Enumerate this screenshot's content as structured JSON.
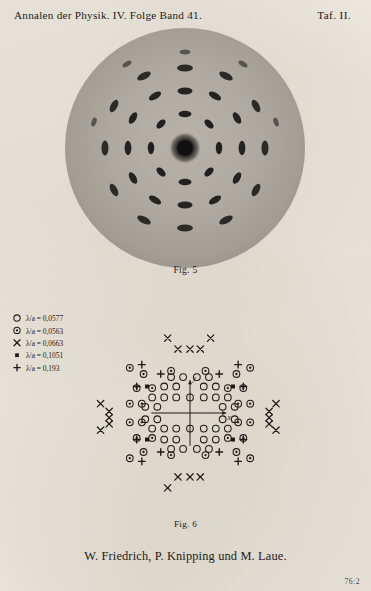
{
  "page": {
    "header_left": "Annalen der Physik.  IV. Folge    Band 41.",
    "header_right": "Taf. II.",
    "corner_mark": "76:2",
    "authors": "W. Friedrich, P. Knipping und M. Laue.",
    "paper_color": "#f2efe9",
    "ink_color": "#1d1b18"
  },
  "figures": {
    "fig5": {
      "caption": "Fig. 5",
      "description": "Laue X-ray diffraction photograph, circular plate with dark central beam spot and concentric rings of elliptical reflection spots showing four-fold symmetry",
      "plate_color": "#a8a49c",
      "center_spot_color": "#141414"
    },
    "fig6": {
      "caption": "Fig. 6",
      "axis_x_label": "x",
      "axis_y_label": "y",
      "description": "Indexed spot diagram of the Laue photograph; symbol type encodes the wavelength ratio lambda over a"
    }
  },
  "legend": {
    "items": [
      {
        "symbol": "open-circle",
        "label": "λ/a = 0,0577",
        "value": 0.0577
      },
      {
        "symbol": "circle-dot",
        "label": "λ/a = 0,0563",
        "value": 0.0563
      },
      {
        "symbol": "cross",
        "label": "λ/a = 0,0663",
        "value": 0.0663
      },
      {
        "symbol": "filled-square",
        "label": "λ/a = 0,1051",
        "value": 0.1051
      },
      {
        "symbol": "plus",
        "label": "λ/a = 0,193",
        "value": 0.193
      }
    ]
  },
  "chart_data": {
    "type": "scatter",
    "title": "Fig. 6",
    "xlabel": "x",
    "ylabel": "y",
    "grid": false,
    "legend_position": "upper-left",
    "xlim": [
      -115,
      115
    ],
    "ylim": [
      -105,
      105
    ],
    "series": [
      {
        "name": "λ/a = 0,0577",
        "symbol": "open-circle",
        "points": [
          [
            -30,
            34
          ],
          [
            -16,
            34
          ],
          [
            16,
            34
          ],
          [
            30,
            34
          ],
          [
            -44,
            20
          ],
          [
            -30,
            20
          ],
          [
            -16,
            20
          ],
          [
            0,
            20
          ],
          [
            16,
            20
          ],
          [
            30,
            20
          ],
          [
            44,
            20
          ],
          [
            -52,
            8
          ],
          [
            -38,
            8
          ],
          [
            38,
            8
          ],
          [
            52,
            8
          ],
          [
            -52,
            -8
          ],
          [
            -38,
            -8
          ],
          [
            38,
            -8
          ],
          [
            52,
            -8
          ],
          [
            -44,
            -20
          ],
          [
            -30,
            -20
          ],
          [
            -16,
            -20
          ],
          [
            0,
            -20
          ],
          [
            16,
            -20
          ],
          [
            30,
            -20
          ],
          [
            44,
            -20
          ],
          [
            -30,
            -34
          ],
          [
            -16,
            -34
          ],
          [
            16,
            -34
          ],
          [
            30,
            -34
          ],
          [
            -22,
            46
          ],
          [
            22,
            46
          ],
          [
            -22,
            -46
          ],
          [
            22,
            -46
          ],
          [
            -8,
            46
          ],
          [
            8,
            46
          ],
          [
            -8,
            -46
          ],
          [
            8,
            -46
          ]
        ]
      },
      {
        "name": "λ/a = 0,0563",
        "symbol": "circle-dot",
        "points": [
          [
            -70,
            58
          ],
          [
            -54,
            50
          ],
          [
            -22,
            54
          ],
          [
            18,
            54
          ],
          [
            54,
            50
          ],
          [
            70,
            58
          ],
          [
            -62,
            32
          ],
          [
            -44,
            32
          ],
          [
            44,
            32
          ],
          [
            62,
            32
          ],
          [
            -70,
            12
          ],
          [
            -56,
            12
          ],
          [
            56,
            12
          ],
          [
            70,
            12
          ],
          [
            -70,
            -12
          ],
          [
            -56,
            -12
          ],
          [
            56,
            -12
          ],
          [
            70,
            -12
          ],
          [
            -62,
            -32
          ],
          [
            -44,
            -32
          ],
          [
            44,
            -32
          ],
          [
            62,
            -32
          ],
          [
            -70,
            -58
          ],
          [
            -54,
            -50
          ],
          [
            -22,
            -54
          ],
          [
            18,
            -54
          ],
          [
            54,
            -50
          ],
          [
            70,
            -58
          ]
        ]
      },
      {
        "name": "λ/a = 0,0663",
        "symbol": "cross",
        "points": [
          [
            -26,
            96
          ],
          [
            24,
            96
          ],
          [
            -14,
            82
          ],
          [
            0,
            82
          ],
          [
            12,
            82
          ],
          [
            -26,
            -96
          ],
          [
            -14,
            -82
          ],
          [
            0,
            -82
          ],
          [
            12,
            -82
          ],
          [
            -104,
            12
          ],
          [
            -94,
            2
          ],
          [
            -94,
            -6
          ],
          [
            -94,
            -14
          ],
          [
            -104,
            -22
          ],
          [
            100,
            12
          ],
          [
            92,
            2
          ],
          [
            92,
            -6
          ],
          [
            92,
            -14
          ],
          [
            100,
            -22
          ]
        ]
      },
      {
        "name": "λ/a = 0,1051",
        "symbol": "filled-square",
        "points": [
          [
            -50,
            34
          ],
          [
            50,
            34
          ],
          [
            -50,
            -34
          ],
          [
            50,
            -34
          ]
        ]
      },
      {
        "name": "λ/a = 0,193",
        "symbol": "plus",
        "points": [
          [
            -34,
            50
          ],
          [
            34,
            50
          ],
          [
            -62,
            34
          ],
          [
            62,
            34
          ],
          [
            -34,
            -50
          ],
          [
            34,
            -50
          ],
          [
            -62,
            -34
          ],
          [
            62,
            -34
          ],
          [
            -56,
            -62
          ],
          [
            -56,
            62
          ],
          [
            56,
            62
          ],
          [
            56,
            -62
          ]
        ]
      }
    ]
  }
}
